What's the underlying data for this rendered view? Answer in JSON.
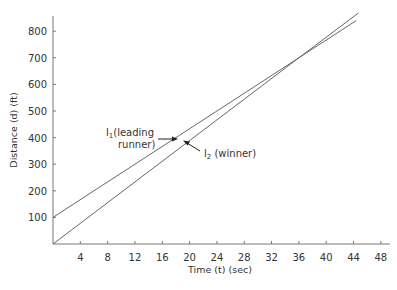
{
  "chart_data": {
    "type": "line",
    "title": "",
    "xlabel": "Time (t) (sec)",
    "ylabel": "Distance (d) (ft)",
    "xlim": [
      0,
      50
    ],
    "ylim": [
      0,
      850
    ],
    "x_ticks": [
      4,
      8,
      12,
      16,
      20,
      24,
      28,
      32,
      36,
      40,
      44,
      48
    ],
    "y_ticks": [
      100,
      200,
      300,
      400,
      500,
      600,
      700,
      800
    ],
    "grid": false,
    "legend": "none (inline annotations)",
    "series": [
      {
        "name": "l1 (leading runner)",
        "points": [
          [
            0,
            100
          ],
          [
            36,
            700
          ],
          [
            44.4,
            840
          ]
        ],
        "color": "#666666"
      },
      {
        "name": "l2 (winner)",
        "points": [
          [
            0,
            0
          ],
          [
            36,
            700
          ],
          [
            44.7,
            868
          ]
        ],
        "color": "#666666"
      }
    ],
    "annotations": [
      {
        "text_main": "l",
        "sub": "1",
        "text_rest": "(leading",
        "text_line2": "runner)",
        "target": "l1"
      },
      {
        "text_main": "l",
        "sub": "2",
        "text_rest": " (winner)",
        "target": "l2"
      }
    ]
  },
  "labels": {
    "xlabel": "Time (t) (sec)",
    "ylabel": "Distance (d) (ft)",
    "l1_main": "l",
    "l1_sub": "1",
    "l1_rest": "(leading",
    "l1_line2": "runner)",
    "l2_main": "l",
    "l2_sub": "2",
    "l2_rest": " (winner)"
  }
}
